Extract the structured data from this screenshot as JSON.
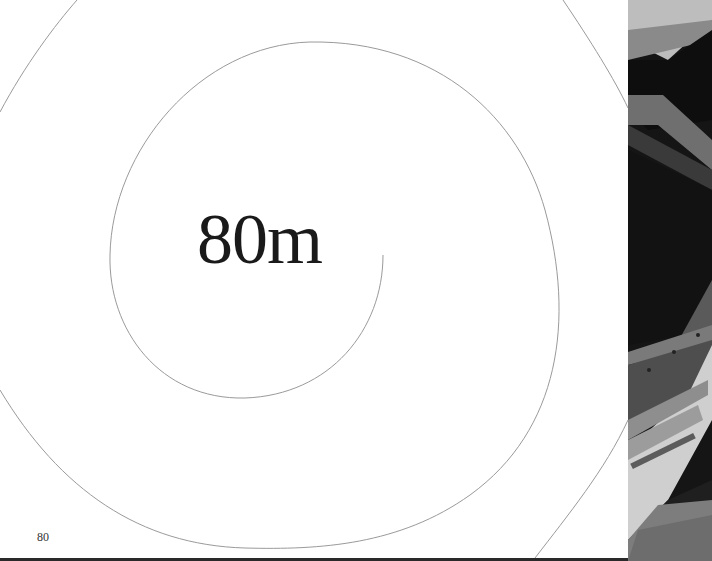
{
  "page": {
    "headline": "80m",
    "page_number": "80"
  },
  "photo": {
    "description": "black-and-white photograph of angled steel structure and bolted plates over grass"
  },
  "colors": {
    "background": "#ffffff",
    "text": "#1a1a1a",
    "spiral_line": "#9a9a9a",
    "photo_dark": "#1b1b1b"
  }
}
